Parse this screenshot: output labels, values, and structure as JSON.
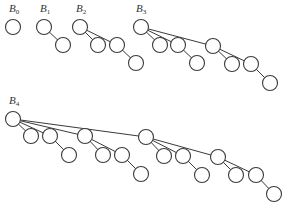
{
  "diagram": {
    "node_radius": 7.5,
    "trees": [
      {
        "label": "B",
        "subscript": "0",
        "label_pos": [
          9,
          12
        ],
        "nodes": [
          [
            13,
            27
          ]
        ],
        "edges": []
      },
      {
        "label": "B",
        "subscript": "1",
        "label_pos": [
          40,
          12
        ],
        "nodes": [
          [
            44,
            27
          ],
          [
            63,
            45
          ]
        ],
        "edges": [
          [
            0,
            1
          ]
        ]
      },
      {
        "label": "B",
        "subscript": "2",
        "label_pos": [
          76,
          12
        ],
        "nodes": [
          [
            80,
            27
          ],
          [
            98,
            45
          ],
          [
            117,
            45
          ],
          [
            136,
            63
          ]
        ],
        "edges": [
          [
            0,
            1
          ],
          [
            0,
            2
          ],
          [
            2,
            3
          ]
        ]
      },
      {
        "label": "B",
        "subscript": "3",
        "label_pos": [
          136,
          12
        ],
        "nodes": [
          [
            141,
            27
          ],
          [
            160,
            45
          ],
          [
            178,
            45
          ],
          [
            197,
            63
          ],
          [
            213,
            46
          ],
          [
            232,
            64
          ],
          [
            251,
            64
          ],
          [
            270,
            83
          ]
        ],
        "edges": [
          [
            0,
            1
          ],
          [
            0,
            2
          ],
          [
            2,
            3
          ],
          [
            0,
            4
          ],
          [
            4,
            5
          ],
          [
            4,
            6
          ],
          [
            6,
            7
          ]
        ]
      },
      {
        "label": "B",
        "subscript": "4",
        "label_pos": [
          9,
          104
        ],
        "nodes": [
          [
            13,
            119
          ],
          [
            31,
            136
          ],
          [
            50,
            136
          ],
          [
            69,
            155
          ],
          [
            85,
            136
          ],
          [
            103,
            155
          ],
          [
            122,
            155
          ],
          [
            141,
            174
          ],
          [
            146,
            137
          ],
          [
            164,
            156
          ],
          [
            183,
            156
          ],
          [
            202,
            175
          ],
          [
            218,
            157
          ],
          [
            236,
            175
          ],
          [
            256,
            175
          ],
          [
            274,
            194
          ]
        ],
        "edges": [
          [
            0,
            1
          ],
          [
            0,
            2
          ],
          [
            2,
            3
          ],
          [
            0,
            4
          ],
          [
            4,
            5
          ],
          [
            4,
            6
          ],
          [
            6,
            7
          ],
          [
            0,
            8
          ],
          [
            8,
            9
          ],
          [
            8,
            10
          ],
          [
            10,
            11
          ],
          [
            8,
            12
          ],
          [
            12,
            13
          ],
          [
            12,
            14
          ],
          [
            14,
            15
          ]
        ]
      }
    ]
  }
}
